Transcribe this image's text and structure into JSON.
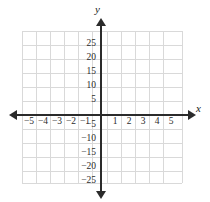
{
  "figure": {
    "kind": "cartesian-coordinate-plane",
    "background_color": "#ffffff",
    "grid_color": "#d9d9d9",
    "axis_color": "#2b2b2b",
    "label_color": "#2b2b2b"
  },
  "axes": {
    "x_name": "x",
    "y_name": "y",
    "x_arrow_left": "arrow-left-icon",
    "x_arrow_right": "arrow-right-icon",
    "y_arrow_up": "arrow-up-icon",
    "y_arrow_down": "arrow-down-icon"
  },
  "chart_data": {
    "type": "scatter",
    "title": "",
    "subtitle": "",
    "xlabel": "x",
    "ylabel": "y",
    "grid": true,
    "legend": null,
    "series": [],
    "xlim": [
      -5.5,
      5.5
    ],
    "ylim": [
      -27.5,
      27.5
    ],
    "x_tick_step": 1,
    "y_tick_step": 5,
    "x_ticks": [
      -5,
      -4,
      -3,
      -2,
      -1,
      1,
      2,
      3,
      4,
      5
    ],
    "y_ticks": [
      25,
      20,
      15,
      10,
      5,
      -5,
      -10,
      -15,
      -20,
      -25
    ],
    "x_tick_labels": [
      "−5",
      "−4",
      "−3",
      "−2",
      "−1",
      "1",
      "2",
      "3",
      "4",
      "5"
    ],
    "y_tick_labels": [
      "25",
      "20",
      "15",
      "10",
      "5",
      "−5",
      "−10",
      "−15",
      "−20",
      "−25"
    ],
    "grid_columns": 11,
    "grid_rows": 11,
    "annotations": []
  },
  "x_axis_labels": [
    {
      "text": "−5",
      "left": 22,
      "top": 117
    },
    {
      "text": "−4",
      "left": 36,
      "top": 117
    },
    {
      "text": "−3",
      "left": 50,
      "top": 117
    },
    {
      "text": "−2",
      "left": 64,
      "top": 117
    },
    {
      "text": "−1",
      "left": 78,
      "top": 117
    },
    {
      "text": "1",
      "left": 108,
      "top": 117
    },
    {
      "text": "2",
      "left": 122,
      "top": 117
    },
    {
      "text": "3",
      "left": 136,
      "top": 117
    },
    {
      "text": "4",
      "left": 150,
      "top": 117
    },
    {
      "text": "5",
      "left": 164,
      "top": 117
    }
  ],
  "y_axis_labels": [
    {
      "text": "25",
      "left": 72,
      "top": 39
    },
    {
      "text": "20",
      "left": 72,
      "top": 53
    },
    {
      "text": "15",
      "left": 72,
      "top": 67
    },
    {
      "text": "10",
      "left": 72,
      "top": 81
    },
    {
      "text": "5",
      "left": 72,
      "top": 95
    },
    {
      "text": "−5",
      "left": 72,
      "top": 120
    },
    {
      "text": "−10",
      "left": 72,
      "top": 134
    },
    {
      "text": "−15",
      "left": 72,
      "top": 148
    },
    {
      "text": "−20",
      "left": 72,
      "top": 162
    },
    {
      "text": "−25",
      "left": 72,
      "top": 176
    }
  ],
  "grid_lines": {
    "vertical_x": [
      22,
      36,
      50,
      64,
      78,
      92,
      107,
      121,
      135,
      149,
      163,
      182
    ],
    "horizontal_y": [
      31,
      45,
      59,
      73,
      87,
      101,
      115,
      129,
      143,
      157,
      171,
      183
    ]
  }
}
